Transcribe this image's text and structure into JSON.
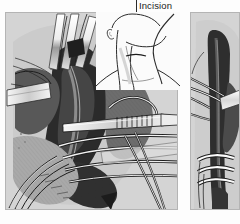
{
  "figure": {
    "kind": "surgical-illustration",
    "background_color": "#fdfdfd",
    "panel_color": "#d4d4d4",
    "ink_color": "#1b1b1b",
    "width": 240,
    "height": 224
  },
  "annotations": {
    "incision_label": "Incision"
  },
  "panels": [
    {
      "id": "main-operative-field",
      "name": "left-operative-field-panel",
      "position": {
        "x": 5,
        "y": 12,
        "w": 173,
        "h": 198
      },
      "contents": [
        "retractors",
        "tissue-flaps",
        "dark-muscle-mass",
        "vessels",
        "serrated-forceps",
        "instrument-shafts",
        "suture-threads"
      ]
    },
    {
      "id": "detail-vessel",
      "name": "right-vessel-detail-panel",
      "position": {
        "x": 190,
        "y": 12,
        "w": 50,
        "h": 198
      },
      "contents": [
        "dark-vessel-trunk",
        "white-ligature-bands",
        "retracting-instrument"
      ]
    }
  ],
  "inset": {
    "name": "head-neck-profile-inset",
    "description": "line-drawing profile of head and neck",
    "position": {
      "x": 96,
      "y": 12,
      "w": 84,
      "h": 78
    },
    "background_color": "#fbfbfb"
  },
  "palette": {
    "paper": "#fdfdfd",
    "panel": "#d4d4d4",
    "tissue_dark": "#2e2e2e",
    "tissue_mid": "#6a6a6a",
    "tissue_light": "#9d9d9d",
    "instrument_light": "#f2f2f2",
    "instrument_shadow": "#8e8e8e",
    "suture_white": "#fbfbfb",
    "outline": "#1b1b1b"
  }
}
